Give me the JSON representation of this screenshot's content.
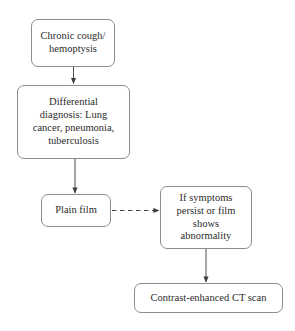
{
  "diagram": {
    "type": "flowchart",
    "background_color": "#ffffff",
    "node_border_color": "#8c8c8c",
    "text_color": "#2b2b2b",
    "edge_color": "#4d4d4d",
    "nodes": [
      {
        "id": "chronic-cough",
        "label": "Chronic cough/\nhemoptysis",
        "shape": "rounded-rectangle"
      },
      {
        "id": "differential",
        "label": "Differential\ndiagnosis: Lung\ncancer, pneumonia,\ntuberculosis",
        "shape": "rounded-rectangle"
      },
      {
        "id": "plain-film",
        "label": "Plain film",
        "shape": "rounded-rectangle"
      },
      {
        "id": "if-symptoms",
        "label": "If symptoms\npersist or film\nshows\nabnormality",
        "shape": "rounded-rectangle"
      },
      {
        "id": "ct-scan",
        "label": "Contrast-enhanced CT scan",
        "shape": "rounded-rectangle"
      }
    ],
    "edges": [
      {
        "id": "chronic-cough-to-differential",
        "from": "chronic-cough",
        "to": "differential",
        "style": "solid",
        "arrow": "filled-triangle",
        "direction": "down"
      },
      {
        "id": "differential-to-plain-film",
        "from": "differential",
        "to": "plain-film",
        "style": "solid",
        "arrow": "filled-triangle",
        "direction": "down"
      },
      {
        "id": "plain-film-to-if-symptoms",
        "from": "plain-film",
        "to": "if-symptoms",
        "style": "dashed",
        "arrow": "filled-triangle",
        "direction": "right"
      },
      {
        "id": "if-symptoms-to-ct-scan",
        "from": "if-symptoms",
        "to": "ct-scan",
        "style": "solid",
        "arrow": "filled-triangle",
        "direction": "down"
      }
    ]
  }
}
